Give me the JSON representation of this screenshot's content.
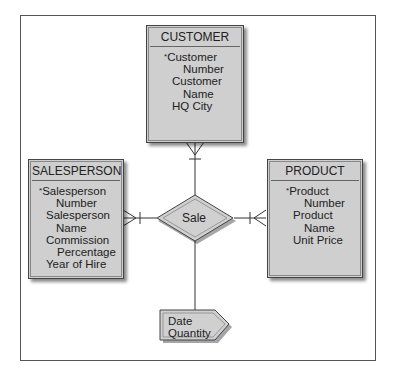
{
  "diagram": {
    "type": "entity-relationship",
    "entities": [
      {
        "name": "CUSTOMER",
        "attributes": [
          {
            "label": "Customer",
            "key": true
          },
          {
            "label": "Number",
            "indent": true
          },
          {
            "label": "Customer"
          },
          {
            "label": "Name",
            "indent": true
          },
          {
            "label": "HQ City"
          }
        ]
      },
      {
        "name": "SALESPERSON",
        "attributes": [
          {
            "label": "Salesperson",
            "key": true
          },
          {
            "label": "Number",
            "indent": true
          },
          {
            "label": "Salesperson"
          },
          {
            "label": "Name",
            "indent": true
          },
          {
            "label": "Commission"
          },
          {
            "label": "Percentage",
            "indent": true
          },
          {
            "label": "Year of Hire"
          }
        ]
      },
      {
        "name": "PRODUCT",
        "attributes": [
          {
            "label": "Product",
            "key": true
          },
          {
            "label": "Number",
            "indent": true
          },
          {
            "label": "Product"
          },
          {
            "label": "Name",
            "indent": true
          },
          {
            "label": "Unit Price"
          }
        ]
      }
    ],
    "relationship": {
      "name": "Sale",
      "intersection_attributes": [
        "Date",
        "Quantity"
      ]
    },
    "key_marker": "*",
    "colors": {
      "entity_fill": "#cfcfcf",
      "border": "#444444",
      "line": "#333333"
    }
  }
}
